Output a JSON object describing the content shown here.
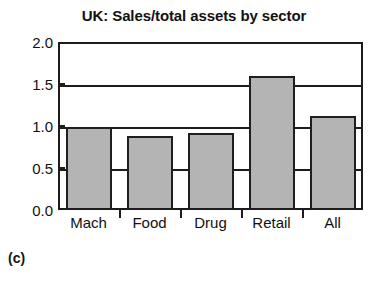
{
  "chart_data": {
    "type": "bar",
    "title": "UK: Sales/total assets by sector",
    "xlabel": "",
    "ylabel": "",
    "categories": [
      "Mach",
      "Food",
      "Drug",
      "Retail",
      "All"
    ],
    "values": [
      0.99,
      0.88,
      0.92,
      1.6,
      1.12
    ],
    "ylim": [
      0.0,
      2.0
    ],
    "yticks": [
      "0.0",
      "0.5",
      "1.0",
      "1.5",
      "2.0"
    ],
    "ytick_values": [
      0.0,
      0.5,
      1.0,
      1.5,
      2.0
    ],
    "grid": "horizontal",
    "legend": "none",
    "bar_fill_color": "#b4b4b4",
    "bar_edge_color": "#1f1f1f",
    "axis_color": "#1c1c1c",
    "background_color": "#ffffff"
  },
  "figure": {
    "caption": "(c)"
  }
}
